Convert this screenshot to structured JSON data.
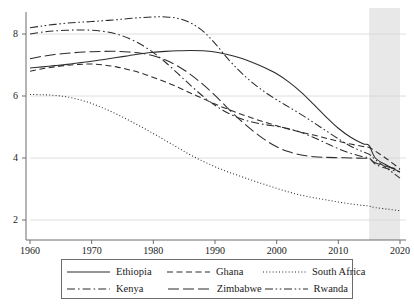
{
  "chart_data": {
    "type": "line",
    "title": "",
    "subtitle": "",
    "xlabel": "",
    "ylabel": "",
    "xlim": [
      1960,
      2020
    ],
    "ylim": [
      2,
      8.8
    ],
    "xticks": [
      1960,
      1970,
      1980,
      1990,
      2000,
      2010,
      2020
    ],
    "yticks": [
      2,
      4,
      6,
      8
    ],
    "grid": "horizontal",
    "legend_position": "bottom",
    "annotations": [
      {
        "name": "projection-band",
        "type": "shaded-x-range",
        "from": 2015,
        "to": 2020,
        "color": "#e8e8e8"
      }
    ],
    "x": [
      1960,
      1962,
      1964,
      1966,
      1968,
      1970,
      1972,
      1974,
      1976,
      1978,
      1980,
      1982,
      1984,
      1986,
      1988,
      1990,
      1992,
      1994,
      1996,
      1998,
      2000,
      2002,
      2004,
      2006,
      2008,
      2010,
      2012,
      2014,
      2015,
      2016,
      2018,
      2020
    ],
    "series": [
      {
        "name": "Ethiopia",
        "style": "solid",
        "color": "#2b2b2b",
        "values": [
          6.9,
          6.94,
          6.98,
          7.02,
          7.07,
          7.12,
          7.18,
          7.24,
          7.3,
          7.36,
          7.41,
          7.44,
          7.46,
          7.47,
          7.46,
          7.42,
          7.34,
          7.23,
          7.09,
          6.92,
          6.72,
          6.45,
          6.12,
          5.73,
          5.33,
          4.96,
          4.67,
          4.46,
          4.4,
          4.0,
          3.75,
          3.55
        ]
      },
      {
        "name": "Ghana",
        "style": "dashed",
        "color": "#2b2b2b",
        "values": [
          6.8,
          6.88,
          6.94,
          6.99,
          7.02,
          7.03,
          7.0,
          6.94,
          6.85,
          6.74,
          6.6,
          6.45,
          6.28,
          6.1,
          5.92,
          5.74,
          5.58,
          5.43,
          5.29,
          5.16,
          5.04,
          4.93,
          4.83,
          4.74,
          4.64,
          4.54,
          4.45,
          4.37,
          4.34,
          4.22,
          3.95,
          3.65
        ]
      },
      {
        "name": "South Africa",
        "style": "dotted",
        "color": "#2b2b2b",
        "values": [
          6.05,
          6.04,
          6.02,
          5.97,
          5.88,
          5.76,
          5.6,
          5.42,
          5.22,
          5.01,
          4.79,
          4.56,
          4.33,
          4.1,
          3.9,
          3.72,
          3.56,
          3.42,
          3.28,
          3.15,
          3.02,
          2.9,
          2.8,
          2.72,
          2.65,
          2.58,
          2.52,
          2.47,
          2.45,
          2.4,
          2.35,
          2.3
        ]
      },
      {
        "name": "Kenya",
        "style": "dashdot",
        "color": "#2b2b2b",
        "values": [
          8.0,
          8.06,
          8.1,
          8.12,
          8.13,
          8.12,
          8.08,
          8.0,
          7.86,
          7.66,
          7.4,
          7.08,
          6.72,
          6.35,
          6.0,
          5.7,
          5.46,
          5.28,
          5.16,
          5.08,
          5.02,
          4.94,
          4.82,
          4.66,
          4.48,
          4.3,
          4.15,
          4.04,
          4.0,
          3.8,
          3.65,
          3.55
        ]
      },
      {
        "name": "Zimbabwe",
        "style": "longdash",
        "color": "#2b2b2b",
        "values": [
          7.2,
          7.28,
          7.34,
          7.38,
          7.41,
          7.43,
          7.44,
          7.44,
          7.42,
          7.38,
          7.3,
          7.16,
          6.96,
          6.7,
          6.38,
          6.02,
          5.62,
          5.24,
          4.9,
          4.6,
          4.36,
          4.2,
          4.1,
          4.04,
          4.02,
          4.01,
          4.0,
          3.99,
          3.98,
          3.85,
          3.72,
          3.62
        ]
      },
      {
        "name": "Rwanda",
        "style": "dashdotdot",
        "color": "#2b2b2b",
        "values": [
          8.2,
          8.26,
          8.31,
          8.35,
          8.38,
          8.4,
          8.43,
          8.46,
          8.5,
          8.53,
          8.55,
          8.55,
          8.5,
          8.36,
          8.1,
          7.7,
          7.22,
          6.8,
          6.44,
          6.14,
          5.88,
          5.64,
          5.4,
          5.14,
          4.88,
          4.62,
          4.38,
          4.2,
          4.12,
          3.95,
          3.65,
          3.35
        ]
      }
    ]
  },
  "axis": {
    "ytick_labels": [
      "8",
      "6",
      "4",
      "2"
    ],
    "xtick_labels": [
      "1960",
      "1970",
      "1980",
      "1990",
      "2000",
      "2010",
      "2020"
    ]
  },
  "legend": {
    "rows": [
      [
        {
          "label": "Ethiopia",
          "style": "solid"
        },
        {
          "label": "Ghana",
          "style": "dashed"
        },
        {
          "label": "South Africa",
          "style": "dotted"
        }
      ],
      [
        {
          "label": "Kenya",
          "style": "dashdot"
        },
        {
          "label": "Zimbabwe",
          "style": "longdash"
        },
        {
          "label": "Rwanda",
          "style": "dashdotdot"
        }
      ]
    ]
  }
}
